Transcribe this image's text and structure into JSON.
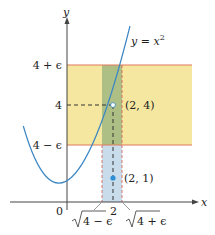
{
  "figure": {
    "type": "diagram",
    "curve": {
      "label": "y = x",
      "exponent": "2",
      "equation": "y = x^2"
    },
    "axes": {
      "x_label": "x",
      "y_label": "y",
      "origin_label": "0"
    },
    "y_ticks": [
      {
        "label": "4 + ϵ",
        "value": "4+epsilon"
      },
      {
        "label": "4",
        "value": "4"
      },
      {
        "label": "4 − ϵ",
        "value": "4-epsilon"
      }
    ],
    "x_ticks": [
      {
        "label": "√4 − ϵ",
        "radicand": "4 − ϵ",
        "value": "sqrt(4-epsilon)"
      },
      {
        "label": "2",
        "value": "2"
      },
      {
        "label": "√4 + ϵ",
        "radicand": "4 + ϵ",
        "value": "sqrt(4+epsilon)"
      }
    ],
    "points": [
      {
        "label": "(2, 4)",
        "style": "hollow"
      },
      {
        "label": "(2, 1)",
        "style": "filled"
      }
    ],
    "colors": {
      "curve": "#3b87c4",
      "band_line": "#e07a5a",
      "yellow_band": "#f6e7a0",
      "green_overlap": "#aebf86",
      "blue_strip": "#c9dcec",
      "axis": "#444444",
      "dash_dark": "#333333",
      "dash_red": "#d9665a",
      "point_blue": "#2f8fd6"
    }
  }
}
